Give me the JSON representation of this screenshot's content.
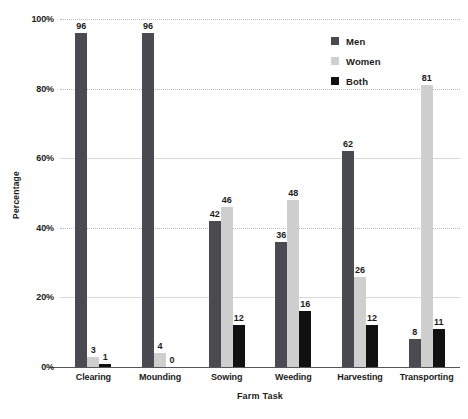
{
  "chart_data": {
    "type": "bar",
    "title": "",
    "xlabel": "Farm Task",
    "ylabel": "Percentage",
    "categories": [
      "Clearing",
      "Mounding",
      "Sowing",
      "Weeding",
      "Harvesting",
      "Transporting"
    ],
    "series": [
      {
        "name": "Men",
        "color": "#4a4a50",
        "values": [
          96,
          96,
          42,
          36,
          62,
          8
        ]
      },
      {
        "name": "Women",
        "color": "#cfcfcf",
        "values": [
          3,
          4,
          46,
          48,
          26,
          81
        ]
      },
      {
        "name": "Both",
        "color": "#111111",
        "values": [
          1,
          0,
          12,
          16,
          12,
          11
        ]
      }
    ],
    "ylim": [
      0,
      100
    ],
    "yticks": [
      "0%",
      "20%",
      "40%",
      "60%",
      "80%",
      "100%"
    ],
    "ytick_values": [
      0,
      20,
      40,
      60,
      80,
      100
    ],
    "grid": true,
    "grid_style": "dotted-horizontal",
    "legend_position": "top-right",
    "value_labels": true
  },
  "legend": {
    "items": [
      {
        "label": "Men",
        "color": "#4a4a50"
      },
      {
        "label": "Women",
        "color": "#cfcfcf"
      },
      {
        "label": "Both",
        "color": "#111111"
      }
    ]
  }
}
